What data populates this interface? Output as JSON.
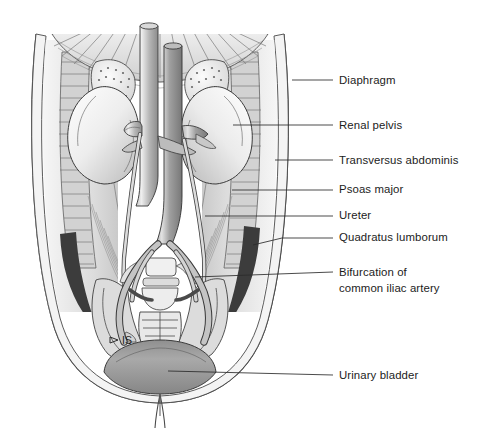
{
  "figure": {
    "background_color": "#ffffff",
    "ink_color": "#2b2b2b",
    "style": "grayscale anatomical line illustration"
  },
  "labels": [
    {
      "id": "diaphragm",
      "text": "Diaphragm",
      "text_x": 339,
      "text_y": 84,
      "leader": "M 292 80 L 333 80",
      "structure": "diaphragm"
    },
    {
      "id": "renal-pelvis",
      "text": "Renal pelvis",
      "text_x": 339,
      "text_y": 129,
      "leader": "M 233 125 L 333 125",
      "structure": "renal-pelvis"
    },
    {
      "id": "transversus-abdominis",
      "text": "Transversus abdominis",
      "text_x": 339,
      "text_y": 164,
      "leader": "M 275 160 L 333 160",
      "structure": "transversus-abdominis"
    },
    {
      "id": "psoas-major",
      "text": "Psoas major",
      "text_x": 339,
      "text_y": 193,
      "leader": "M 232 190 L 333 190",
      "structure": "psoas-major"
    },
    {
      "id": "ureter",
      "text": "Ureter",
      "text_x": 339,
      "text_y": 219,
      "leader": "M 205 216 L 333 216",
      "structure": "ureter"
    },
    {
      "id": "quadratus-lumborum",
      "text": "Quadratus lumborum",
      "text_x": 339,
      "text_y": 241,
      "leader": "M 253 245 L 282 238 L 333 238",
      "structure": "quadratus-lumborum"
    },
    {
      "id": "bifurcation-common-iliac-artery",
      "text": "Bifurcation of",
      "text_line_2": "common iliac artery",
      "text_x": 339,
      "text_y": 276,
      "text_y_2": 292,
      "leader": "M 195 277 L 333 272",
      "structure": "aortic-bifurcation"
    },
    {
      "id": "urinary-bladder",
      "text": "Urinary bladder",
      "text_x": 339,
      "text_y": 379,
      "leader": "M 168 371 L 333 375",
      "structure": "urinary-bladder"
    }
  ],
  "inline_markers": [
    {
      "id": "is-marker",
      "text": "IS",
      "text_x": 122,
      "text_y": 341,
      "arrow": "M 110 337 L 118 340 L 110 343 Z",
      "note": "arrowhead pointing right toward ischial spine"
    }
  ],
  "structures": [
    {
      "id": "body-wall",
      "name": "abdominal body wall outline"
    },
    {
      "id": "diaphragm",
      "name": "diaphragm"
    },
    {
      "id": "left-kidney",
      "name": "left kidney"
    },
    {
      "id": "right-kidney",
      "name": "right kidney"
    },
    {
      "id": "left-adrenal-gland",
      "name": "left suprarenal (adrenal) gland"
    },
    {
      "id": "right-adrenal-gland",
      "name": "right suprarenal (adrenal) gland"
    },
    {
      "id": "inferior-vena-cava",
      "name": "inferior vena cava"
    },
    {
      "id": "abdominal-aorta",
      "name": "abdominal aorta"
    },
    {
      "id": "renal-vessels",
      "name": "renal artery and vein"
    },
    {
      "id": "ureter-left",
      "name": "left ureter"
    },
    {
      "id": "ureter-right",
      "name": "right ureter"
    },
    {
      "id": "common-iliac-vessels",
      "name": "common iliac vessels"
    },
    {
      "id": "lumbar-vertebrae",
      "name": "lumbar vertebral bodies"
    },
    {
      "id": "sacrum",
      "name": "sacrum"
    },
    {
      "id": "iliac-bones",
      "name": "iliac bones"
    },
    {
      "id": "urinary-bladder",
      "name": "urinary bladder"
    },
    {
      "id": "urethra",
      "name": "urethra"
    },
    {
      "id": "psoas-major",
      "name": "psoas major muscle"
    },
    {
      "id": "quadratus-lumborum",
      "name": "quadratus lumborum muscle"
    },
    {
      "id": "transversus-abdominis",
      "name": "transversus abdominis muscle"
    },
    {
      "id": "lumbar-fossa-shadow",
      "name": "deep shadow of lumbar fossa"
    }
  ],
  "palette": {
    "paper": "#ffffff",
    "flesh_light": "#f2f2f2",
    "muscle_mid": "#c9c9c9",
    "muscle_dark": "#a8a8a8",
    "organ_light": "#e8e8e8",
    "vessel_dark": "#8e8e8e",
    "vessel_light": "#b8b8b8",
    "bone_light": "#efefef",
    "shadow_deep": "#3a3a3a",
    "line_ink": "#2b2b2b"
  }
}
